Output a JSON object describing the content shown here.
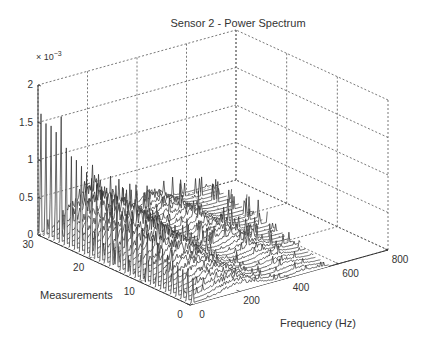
{
  "chart_data": {
    "type": "waterfall-3d-line",
    "title": "Sensor 2 - Power Spectrum",
    "xlabel": "Frequency (Hz)",
    "ylabel": "Measurements",
    "zlabel": "",
    "z_exponent_label": "× 10",
    "z_exponent_power": "−3",
    "xlim": [
      0,
      800
    ],
    "ylim": [
      0,
      30
    ],
    "zlim": [
      0,
      0.002
    ],
    "xticks": [
      0,
      200,
      400,
      600,
      800
    ],
    "yticks": [
      0,
      10,
      20,
      30
    ],
    "zticks": [
      0,
      0.5,
      1,
      1.5,
      2
    ],
    "zticklabels": [
      "0",
      "0.5",
      "1",
      "1.5",
      "2"
    ],
    "grid": true,
    "legend": null,
    "series_description": "31 spectra (measurements 0–30), each a power spectrum over 0–800 Hz with a sharp low-frequency spike and a broad hump near 150–250 Hz",
    "measurements": [
      0,
      1,
      2,
      3,
      4,
      5,
      6,
      7,
      8,
      9,
      10,
      11,
      12,
      13,
      14,
      15,
      16,
      17,
      18,
      19,
      20,
      21,
      22,
      23,
      24,
      25,
      26,
      27,
      28,
      29,
      30
    ],
    "low_freq_spike_peak_e3": [
      0.35,
      0.38,
      0.4,
      0.42,
      0.45,
      0.5,
      0.55,
      0.6,
      0.62,
      0.65,
      0.7,
      0.72,
      0.75,
      0.78,
      0.8,
      0.85,
      0.88,
      0.9,
      0.95,
      1.0,
      1.05,
      1.1,
      1.15,
      1.2,
      1.22,
      1.3,
      1.4,
      1.45,
      1.5,
      1.5,
      1.6
    ],
    "hump_center_hz": 200,
    "hump_peak_e3": [
      0.12,
      0.13,
      0.14,
      0.15,
      0.16,
      0.17,
      0.18,
      0.2,
      0.22,
      0.24,
      0.26,
      0.28,
      0.3,
      0.32,
      0.34,
      0.36,
      0.38,
      0.4,
      0.42,
      0.44,
      0.45,
      0.46,
      0.47,
      0.48,
      0.48,
      0.49,
      0.5,
      0.5,
      0.5,
      0.5,
      0.5
    ],
    "hump_width_hz": 90,
    "spectrum_end_hz": [
      560,
      560,
      570,
      570,
      580,
      580,
      590,
      590,
      600,
      600,
      610,
      610,
      620,
      620,
      630,
      630,
      640,
      640,
      650,
      650,
      660,
      660,
      660,
      670,
      670,
      680,
      680,
      690,
      690,
      700,
      700
    ]
  },
  "colors": {
    "line": "#2a2a2a",
    "spike": "#555555",
    "grid": "#555555",
    "axis": "#333333",
    "text": "#333333",
    "background": "#ffffff"
  }
}
